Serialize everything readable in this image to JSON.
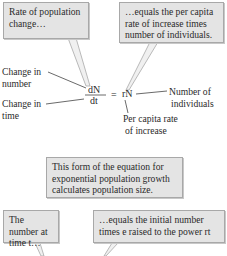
{
  "callouts": {
    "rate_of_change": "Rate of population change…",
    "equals_per_capita": "…equals the per capita rate of increase times number of individuals.",
    "form_note": "This form of the equation for exponential population growth calculates population size.",
    "number_at_time": "The number at time t…",
    "equals_initial": "…equals the initial number times e raised to the power rt"
  },
  "labels": {
    "change_in_number_1": "Change in",
    "change_in_number_2": "number",
    "change_in_time_1": "Change in",
    "change_in_time_2": "time",
    "number_of_1": "Number of",
    "number_of_2": "individuals",
    "per_capita_1": "Per capita rate",
    "per_capita_2": "of increase"
  },
  "equation": {
    "numerator": "dN",
    "denominator": "dt",
    "equals": "=",
    "rhs": "rN"
  },
  "colors": {
    "box_fill": "#e4e4e4",
    "box_border": "#a8a8a8",
    "line": "#444444"
  }
}
